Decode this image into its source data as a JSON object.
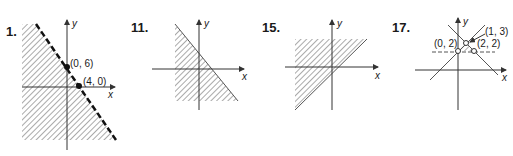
{
  "figures": [
    {
      "number": "1.",
      "points": [
        {
          "label": "(0, 6)"
        },
        {
          "label": "(4, 0)"
        }
      ],
      "axis_x": "x",
      "axis_y": "y",
      "boundary": "dashed"
    },
    {
      "number": "11.",
      "axis_x": "x",
      "axis_y": "y",
      "boundary": "solid"
    },
    {
      "number": "15.",
      "axis_x": "x",
      "axis_y": "y",
      "boundary": "solid"
    },
    {
      "number": "17.",
      "points": [
        {
          "label": "(1, 3)"
        },
        {
          "label": "(0, 2)"
        },
        {
          "label": "(2, 2)"
        }
      ],
      "axis_x": "x",
      "axis_y": "y",
      "boundary": "solid"
    }
  ]
}
